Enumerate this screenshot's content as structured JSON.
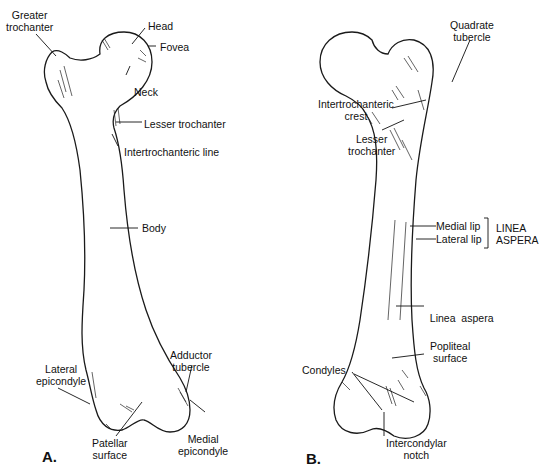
{
  "figure": {
    "background": "#ffffff",
    "ink": "#111111"
  },
  "panels": [
    {
      "id": "A",
      "label": "A.",
      "view": "anterior",
      "annotations": [
        {
          "lines": [
            "Greater",
            "trochanter"
          ]
        },
        {
          "lines": [
            "Head"
          ]
        },
        {
          "lines": [
            "Fovea"
          ]
        },
        {
          "lines": [
            "Neck"
          ]
        },
        {
          "lines": [
            "Lesser trochanter"
          ]
        },
        {
          "lines": [
            "Intertrochanteric line"
          ]
        },
        {
          "lines": [
            "Body"
          ]
        },
        {
          "lines": [
            "Lateral",
            "epicondyle"
          ]
        },
        {
          "lines": [
            "Adductor",
            "tubercle"
          ]
        },
        {
          "lines": [
            "Patellar",
            "surface"
          ]
        },
        {
          "lines": [
            "Medial",
            "epicondyle"
          ]
        }
      ]
    },
    {
      "id": "B",
      "label": "B.",
      "view": "posterior",
      "annotations": [
        {
          "lines": [
            "Quadrate",
            "tubercle"
          ]
        },
        {
          "lines": [
            "Intertrochanteric",
            "crest"
          ]
        },
        {
          "lines": [
            "Lesser",
            "trochanter"
          ]
        },
        {
          "lines": [
            "Medial lip"
          ]
        },
        {
          "lines": [
            "Lateral lip"
          ]
        },
        {
          "lines": [
            "LINEA",
            "ASPERA"
          ]
        },
        {
          "lines": [
            "Linea  aspera"
          ]
        },
        {
          "lines": [
            "Popliteal",
            "surface"
          ]
        },
        {
          "lines": [
            "Condyles"
          ]
        },
        {
          "lines": [
            "Intercondylar",
            "notch"
          ]
        }
      ]
    }
  ],
  "artist_signature": "ACB"
}
